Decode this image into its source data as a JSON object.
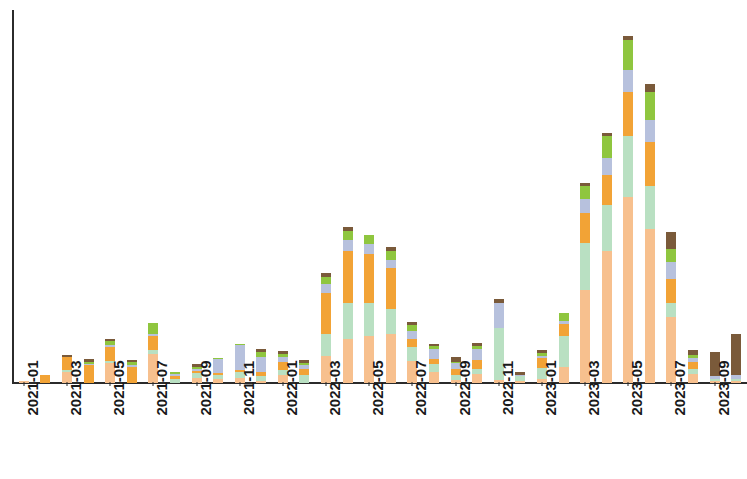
{
  "chart_data": {
    "type": "bar",
    "title": "",
    "subtitle": "",
    "xlabel": "",
    "ylabel": "",
    "stacked": true,
    "grid": false,
    "legend_position": "none",
    "ylim": [
      0,
      100
    ],
    "xtick_labels": [
      "2021-01",
      "2021-03",
      "2021-05",
      "2021-07",
      "2021-09",
      "2021-11",
      "2022-01",
      "2022-03",
      "2022-05",
      "2022-07",
      "2022-09",
      "2022-11",
      "2023-01",
      "2023-03",
      "2023-05",
      "2023-07",
      "2023-09"
    ],
    "xtick_indices": [
      0,
      2,
      4,
      6,
      8,
      10,
      12,
      14,
      16,
      18,
      20,
      22,
      24,
      26,
      28,
      30,
      32
    ],
    "categories": [
      "2021-01",
      "2021-02",
      "2021-03",
      "2021-04",
      "2021-05",
      "2021-06",
      "2021-07",
      "2021-08",
      "2021-09",
      "2021-10",
      "2021-11",
      "2021-12",
      "2022-01",
      "2022-02",
      "2022-03",
      "2022-04",
      "2022-05",
      "2022-06",
      "2022-07",
      "2022-08",
      "2022-09",
      "2022-10",
      "2022-11",
      "2022-12",
      "2023-01",
      "2023-02",
      "2023-03",
      "2023-04",
      "2023-05",
      "2023-06",
      "2023-07",
      "2023-08",
      "2023-09",
      "2023-10"
    ],
    "series": [
      {
        "name": "series-1-peach",
        "color": "#f7c08e",
        "values": [
          0.4,
          0.0,
          2.0,
          0.0,
          3.6,
          0.0,
          5.2,
          0.0,
          1.0,
          0.8,
          1.0,
          0.4,
          1.4,
          0.0,
          5.0,
          8.0,
          8.5,
          9.0,
          4.0,
          2.0,
          0.6,
          1.6,
          0.6,
          0.4,
          0.8,
          3.0,
          17.0,
          24.0,
          34.0,
          28.0,
          12.0,
          1.6,
          0.3,
          0.3
        ]
      },
      {
        "name": "series-2-mint",
        "color": "#b9e0c2",
        "values": [
          0.0,
          0.0,
          0.3,
          0.0,
          0.5,
          0.0,
          0.8,
          0.7,
          0.9,
          0.6,
          1.0,
          0.8,
          1.0,
          1.4,
          4.0,
          6.5,
          6.0,
          4.5,
          2.5,
          1.4,
          0.8,
          1.0,
          9.5,
          0.8,
          2.0,
          5.5,
          8.5,
          8.5,
          11.0,
          8.0,
          2.5,
          1.0,
          0.4,
          0.4
        ]
      },
      {
        "name": "series-3-orange",
        "color": "#f2a336",
        "values": [
          0.0,
          1.4,
          2.4,
          3.2,
          2.4,
          3.0,
          2.6,
          0.5,
          0.3,
          0.4,
          0.4,
          0.9,
          1.5,
          1.2,
          7.5,
          9.5,
          9.0,
          7.5,
          1.6,
          1.0,
          1.2,
          1.6,
          0.0,
          0.0,
          1.8,
          2.2,
          5.5,
          5.5,
          8.0,
          8.0,
          4.5,
          1.2,
          0.0,
          0.0
        ]
      },
      {
        "name": "series-4-bluegray",
        "color": "#b7c1dd",
        "values": [
          0.0,
          0.0,
          0.0,
          0.3,
          0.5,
          0.3,
          0.4,
          0.4,
          0.4,
          2.5,
          4.5,
          2.6,
          0.8,
          0.6,
          1.5,
          2.0,
          1.8,
          1.5,
          1.3,
          1.8,
          1.0,
          2.0,
          4.5,
          0.3,
          0.4,
          0.6,
          2.5,
          3.0,
          4.0,
          4.0,
          3.0,
          0.8,
          0.5,
          0.7
        ]
      },
      {
        "name": "series-5-green",
        "color": "#8fc63f",
        "values": [
          0.0,
          0.0,
          0.0,
          0.3,
          0.6,
          0.5,
          2.0,
          0.5,
          0.3,
          0.3,
          0.3,
          0.9,
          0.6,
          0.5,
          1.4,
          1.8,
          1.6,
          1.6,
          1.2,
          0.5,
          0.3,
          0.5,
          0.0,
          0.0,
          0.4,
          1.4,
          2.4,
          4.0,
          5.5,
          5.0,
          2.5,
          0.6,
          0.0,
          0.0
        ]
      },
      {
        "name": "series-6-brown",
        "color": "#7a5a3a",
        "values": [
          0.0,
          0.0,
          0.5,
          0.6,
          0.5,
          0.4,
          0.0,
          0.0,
          0.5,
          0.0,
          0.0,
          0.6,
          0.5,
          0.5,
          0.6,
          0.7,
          0.0,
          0.7,
          0.6,
          0.5,
          0.8,
          0.6,
          0.7,
          0.6,
          0.6,
          0.0,
          0.6,
          0.6,
          0.8,
          1.5,
          3.0,
          0.8,
          4.5,
          7.5
        ]
      }
    ],
    "colors": {
      "peach": "#f7c08e",
      "mint": "#b9e0c2",
      "orange": "#f2a336",
      "bluegray": "#b7c1dd",
      "green": "#8fc63f",
      "brown": "#7a5a3a",
      "axis": "#2b2b2b",
      "background": "#ffffff"
    },
    "max_total": 68
  }
}
